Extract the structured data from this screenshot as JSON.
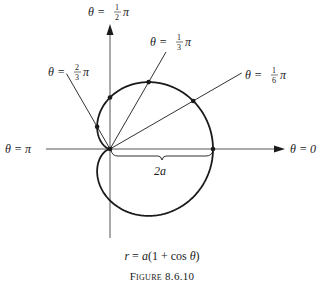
{
  "figure": {
    "caption_title": "Figure 8.6.10",
    "formula": {
      "lhs": "r",
      "eq": " = ",
      "rhs_prefix": "a",
      "rhs_body": "(1 + cos ",
      "rhs_var": "θ",
      "rhs_close": ")"
    },
    "curve": {
      "type": "cardioid",
      "equation": "r = a(1 + cos θ)",
      "param_a": "a"
    },
    "axes": {
      "polar_axis_label": "θ = 0",
      "left_axis_label": "θ = π",
      "vertical_axis_label": {
        "prefix": "θ = ",
        "num": "1",
        "den": "2",
        "suffix": "π"
      }
    },
    "rays": [
      {
        "name": "ray-pi-over-6",
        "angle_fraction_of_pi": 0.1667,
        "label": {
          "prefix": "θ = ",
          "num": "1",
          "den": "6",
          "suffix": "π"
        }
      },
      {
        "name": "ray-pi-over-3",
        "angle_fraction_of_pi": 0.3333,
        "label": {
          "prefix": "θ = ",
          "num": "1",
          "den": "3",
          "suffix": "π"
        }
      },
      {
        "name": "ray-2pi-over-3",
        "angle_fraction_of_pi": 0.6667,
        "label": {
          "prefix": "θ = ",
          "num": "2",
          "den": "3",
          "suffix": "π"
        }
      }
    ],
    "marked_points_angles_fraction_of_pi": [
      0,
      0.1667,
      0.3333,
      0.5,
      0.6667
    ],
    "dimension_label": "2a",
    "colors": {
      "ink": "#1a1a1a",
      "axis": "#555555",
      "background": "#ffffff"
    }
  }
}
